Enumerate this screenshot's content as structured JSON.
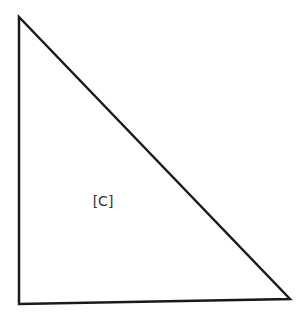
{
  "diagram": {
    "type": "right-triangle",
    "vertices": {
      "top": [
        19,
        17
      ],
      "bottom_left": [
        19,
        304
      ],
      "bottom_right": [
        290,
        299
      ]
    },
    "stroke_color": "#1a1a1a",
    "stroke_width": 2.5,
    "label": {
      "text": "[C]",
      "x": 103,
      "y": 206,
      "color": "#333333"
    }
  }
}
